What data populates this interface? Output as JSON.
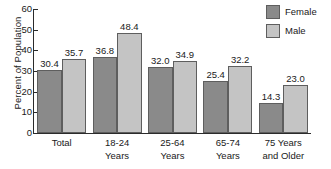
{
  "chart_data": {
    "type": "bar",
    "title": "",
    "xlabel": "",
    "ylabel": "Percent of Population",
    "ylim": [
      0,
      60
    ],
    "ytick_step": 10,
    "yticks": [
      "0",
      "10",
      "20",
      "30",
      "40",
      "50",
      "60"
    ],
    "grid": false,
    "legend_position": "top-right",
    "categories": [
      "Total",
      "18-24\nYears",
      "25-64\nYears",
      "65-74\nYears",
      "75 Years\nand Older"
    ],
    "series": [
      {
        "name": "Female",
        "color": "#8a8a8a",
        "values": [
          30.4,
          36.8,
          32.0,
          25.4,
          14.3
        ],
        "labels": [
          "30.4",
          "36.8",
          "32.0",
          "25.4",
          "14.3"
        ]
      },
      {
        "name": "Male",
        "color": "#c4c4c4",
        "values": [
          35.7,
          48.4,
          34.9,
          32.2,
          23.0
        ],
        "labels": [
          "35.7",
          "48.4",
          "34.9",
          "32.2",
          "23.0"
        ]
      }
    ]
  },
  "legend": {
    "items": [
      {
        "label": "Female",
        "color": "#8a8a8a"
      },
      {
        "label": "Male",
        "color": "#c4c4c4"
      }
    ]
  },
  "colors": {
    "female": "#8a8a8a",
    "male": "#c4c4c4",
    "axis": "#2b2b2b",
    "bar_outline": "#5e5e5e",
    "background": "#ffffff"
  }
}
